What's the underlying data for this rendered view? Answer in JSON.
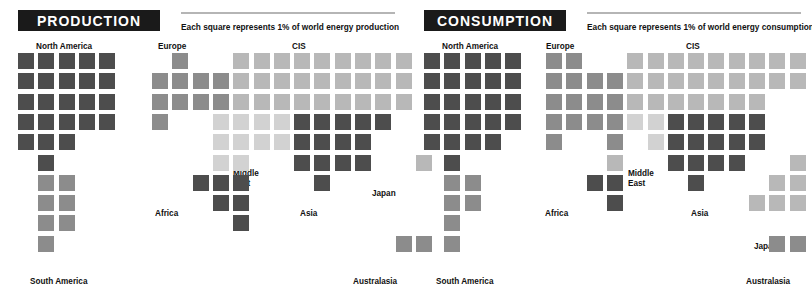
{
  "chart_data": {
    "type": "heatmap",
    "unit_note": "Each square represents 1% of world energy",
    "legend": {
      "production": "Each square represents 1% of world energy production",
      "consumption": "Each square represents 1% of world energy consumption"
    },
    "colors": {
      "dark": "#4d4d4d",
      "mid": "#8c8c8c",
      "light": "#b8b8b8",
      "pale": "#d2d2d2",
      "banner_bg": "#1a1a1a",
      "banner_text": "#ffffff",
      "rule": "#b5b5b5",
      "label_text": "#111111",
      "background": "#ffffff"
    },
    "regions": [
      "North America",
      "South America",
      "Europe",
      "CIS",
      "Middle East",
      "Africa",
      "Asia",
      "Japan",
      "Australasia"
    ],
    "panels": [
      {
        "key": "production",
        "title": "PRODUCTION",
        "legend": "Each square represents 1% of world energy production",
        "series_name": "Share of world energy production (%)",
        "values": {
          "North America": 23,
          "South America": 8,
          "Europe": 9,
          "CIS": 22,
          "Middle East": 11,
          "Africa": 8,
          "Asia": 16,
          "Japan": 1,
          "Australasia": 2
        }
      },
      {
        "key": "consumption",
        "title": "CONSUMPTION",
        "legend": "Each square represents 1% of world energy consumption",
        "series_name": "Share of world energy consumption (%)",
        "values": {
          "North America": 25,
          "South America": 6,
          "Europe": 19,
          "CIS": 15,
          "Middle East": 4,
          "Africa": 4,
          "Asia": 19,
          "Japan": 5,
          "Australasia": 2
        }
      }
    ]
  },
  "production": {
    "title": "PRODUCTION",
    "legend": "Each square represents 1% of world energy production",
    "labels": {
      "north_america": "North America",
      "south_america": "South America",
      "europe": "Europe",
      "cis": "CIS",
      "middle_east_line1": "Middle",
      "middle_east_line2": "East",
      "africa": "Africa",
      "asia": "Asia",
      "japan": "Japan",
      "australasia": "Australasia"
    }
  },
  "consumption": {
    "title": "CONSUMPTION",
    "legend": "Each square represents 1% of world energy consumption",
    "labels": {
      "north_america": "North America",
      "south_america": "South America",
      "europe": "Europe",
      "cis": "CIS",
      "middle_east_line1": "Middle",
      "middle_east_line2": "East",
      "africa": "Africa",
      "asia": "Asia",
      "japan": "Japan",
      "australasia": "Australasia"
    }
  },
  "cells": {
    "production_americas": [
      {
        "c": 0,
        "r": 0,
        "t": "dark"
      },
      {
        "c": 1,
        "r": 0,
        "t": "dark"
      },
      {
        "c": 2,
        "r": 0,
        "t": "dark"
      },
      {
        "c": 3,
        "r": 0,
        "t": "dark"
      },
      {
        "c": 4,
        "r": 0,
        "t": "dark"
      },
      {
        "c": 0,
        "r": 1,
        "t": "dark"
      },
      {
        "c": 1,
        "r": 1,
        "t": "dark"
      },
      {
        "c": 2,
        "r": 1,
        "t": "dark"
      },
      {
        "c": 3,
        "r": 1,
        "t": "dark"
      },
      {
        "c": 4,
        "r": 1,
        "t": "dark"
      },
      {
        "c": 0,
        "r": 2,
        "t": "dark"
      },
      {
        "c": 1,
        "r": 2,
        "t": "dark"
      },
      {
        "c": 2,
        "r": 2,
        "t": "dark"
      },
      {
        "c": 3,
        "r": 2,
        "t": "dark"
      },
      {
        "c": 4,
        "r": 2,
        "t": "dark"
      },
      {
        "c": 0,
        "r": 3,
        "t": "dark"
      },
      {
        "c": 1,
        "r": 3,
        "t": "dark"
      },
      {
        "c": 2,
        "r": 3,
        "t": "dark"
      },
      {
        "c": 3,
        "r": 3,
        "t": "dark"
      },
      {
        "c": 4,
        "r": 3,
        "t": "dark"
      },
      {
        "c": 0,
        "r": 4,
        "t": "dark"
      },
      {
        "c": 1,
        "r": 4,
        "t": "dark"
      },
      {
        "c": 2,
        "r": 4,
        "t": "dark"
      },
      {
        "c": 1,
        "r": 5,
        "t": "dark"
      },
      {
        "c": 1,
        "r": 6,
        "t": "mid"
      },
      {
        "c": 2,
        "r": 6,
        "t": "mid"
      },
      {
        "c": 1,
        "r": 7,
        "t": "mid"
      },
      {
        "c": 2,
        "r": 7,
        "t": "mid"
      },
      {
        "c": 1,
        "r": 8,
        "t": "mid"
      },
      {
        "c": 2,
        "r": 8,
        "t": "mid"
      },
      {
        "c": 1,
        "r": 9,
        "t": "mid"
      }
    ],
    "production_world": [
      {
        "c": 1,
        "r": 0,
        "t": "mid"
      },
      {
        "c": 4,
        "r": 0,
        "t": "light"
      },
      {
        "c": 5,
        "r": 0,
        "t": "light"
      },
      {
        "c": 6,
        "r": 0,
        "t": "light"
      },
      {
        "c": 7,
        "r": 0,
        "t": "light"
      },
      {
        "c": 8,
        "r": 0,
        "t": "light"
      },
      {
        "c": 9,
        "r": 0,
        "t": "light"
      },
      {
        "c": 10,
        "r": 0,
        "t": "light"
      },
      {
        "c": 11,
        "r": 0,
        "t": "light"
      },
      {
        "c": 12,
        "r": 0,
        "t": "light"
      },
      {
        "c": 0,
        "r": 1,
        "t": "mid"
      },
      {
        "c": 1,
        "r": 1,
        "t": "mid"
      },
      {
        "c": 2,
        "r": 1,
        "t": "mid"
      },
      {
        "c": 3,
        "r": 1,
        "t": "mid"
      },
      {
        "c": 4,
        "r": 1,
        "t": "light"
      },
      {
        "c": 5,
        "r": 1,
        "t": "light"
      },
      {
        "c": 6,
        "r": 1,
        "t": "light"
      },
      {
        "c": 7,
        "r": 1,
        "t": "light"
      },
      {
        "c": 8,
        "r": 1,
        "t": "light"
      },
      {
        "c": 9,
        "r": 1,
        "t": "light"
      },
      {
        "c": 10,
        "r": 1,
        "t": "light"
      },
      {
        "c": 11,
        "r": 1,
        "t": "light"
      },
      {
        "c": 12,
        "r": 1,
        "t": "light"
      },
      {
        "c": 0,
        "r": 2,
        "t": "mid"
      },
      {
        "c": 1,
        "r": 2,
        "t": "mid"
      },
      {
        "c": 2,
        "r": 2,
        "t": "mid"
      },
      {
        "c": 3,
        "r": 2,
        "t": "mid"
      },
      {
        "c": 4,
        "r": 2,
        "t": "light"
      },
      {
        "c": 5,
        "r": 2,
        "t": "light"
      },
      {
        "c": 6,
        "r": 2,
        "t": "light"
      },
      {
        "c": 7,
        "r": 2,
        "t": "light"
      },
      {
        "c": 8,
        "r": 2,
        "t": "light"
      },
      {
        "c": 9,
        "r": 2,
        "t": "light"
      },
      {
        "c": 10,
        "r": 2,
        "t": "light"
      },
      {
        "c": 11,
        "r": 2,
        "t": "light"
      },
      {
        "c": 12,
        "r": 2,
        "t": "light"
      },
      {
        "c": 0,
        "r": 3,
        "t": "mid"
      },
      {
        "c": 3,
        "r": 3,
        "t": "pale"
      },
      {
        "c": 4,
        "r": 3,
        "t": "pale"
      },
      {
        "c": 5,
        "r": 3,
        "t": "pale"
      },
      {
        "c": 6,
        "r": 3,
        "t": "pale"
      },
      {
        "c": 7,
        "r": 3,
        "t": "dark"
      },
      {
        "c": 8,
        "r": 3,
        "t": "dark"
      },
      {
        "c": 9,
        "r": 3,
        "t": "dark"
      },
      {
        "c": 10,
        "r": 3,
        "t": "dark"
      },
      {
        "c": 11,
        "r": 3,
        "t": "dark"
      },
      {
        "c": 3,
        "r": 4,
        "t": "pale"
      },
      {
        "c": 4,
        "r": 4,
        "t": "pale"
      },
      {
        "c": 5,
        "r": 4,
        "t": "pale"
      },
      {
        "c": 6,
        "r": 4,
        "t": "pale"
      },
      {
        "c": 7,
        "r": 4,
        "t": "dark"
      },
      {
        "c": 8,
        "r": 4,
        "t": "dark"
      },
      {
        "c": 9,
        "r": 4,
        "t": "dark"
      },
      {
        "c": 10,
        "r": 4,
        "t": "dark"
      },
      {
        "c": 3,
        "r": 5,
        "t": "pale"
      },
      {
        "c": 4,
        "r": 5,
        "t": "pale"
      },
      {
        "c": 7,
        "r": 5,
        "t": "dark"
      },
      {
        "c": 8,
        "r": 5,
        "t": "dark"
      },
      {
        "c": 9,
        "r": 5,
        "t": "dark"
      },
      {
        "c": 10,
        "r": 5,
        "t": "dark"
      },
      {
        "c": 13,
        "r": 5,
        "t": "light"
      },
      {
        "c": 2,
        "r": 6,
        "t": "dark"
      },
      {
        "c": 3,
        "r": 6,
        "t": "dark"
      },
      {
        "c": 4,
        "r": 6,
        "t": "dark"
      },
      {
        "c": 8,
        "r": 6,
        "t": "dark"
      },
      {
        "c": 3,
        "r": 7,
        "t": "dark"
      },
      {
        "c": 4,
        "r": 7,
        "t": "dark"
      },
      {
        "c": 4,
        "r": 8,
        "t": "dark"
      },
      {
        "c": 12,
        "r": 9,
        "t": "mid"
      },
      {
        "c": 13,
        "r": 9,
        "t": "mid"
      }
    ],
    "consumption_americas": [
      {
        "c": 0,
        "r": 0,
        "t": "dark"
      },
      {
        "c": 1,
        "r": 0,
        "t": "dark"
      },
      {
        "c": 2,
        "r": 0,
        "t": "dark"
      },
      {
        "c": 3,
        "r": 0,
        "t": "dark"
      },
      {
        "c": 4,
        "r": 0,
        "t": "dark"
      },
      {
        "c": 0,
        "r": 1,
        "t": "dark"
      },
      {
        "c": 1,
        "r": 1,
        "t": "dark"
      },
      {
        "c": 2,
        "r": 1,
        "t": "dark"
      },
      {
        "c": 3,
        "r": 1,
        "t": "dark"
      },
      {
        "c": 4,
        "r": 1,
        "t": "dark"
      },
      {
        "c": 0,
        "r": 2,
        "t": "dark"
      },
      {
        "c": 1,
        "r": 2,
        "t": "dark"
      },
      {
        "c": 2,
        "r": 2,
        "t": "dark"
      },
      {
        "c": 3,
        "r": 2,
        "t": "dark"
      },
      {
        "c": 4,
        "r": 2,
        "t": "dark"
      },
      {
        "c": 0,
        "r": 3,
        "t": "dark"
      },
      {
        "c": 1,
        "r": 3,
        "t": "dark"
      },
      {
        "c": 2,
        "r": 3,
        "t": "dark"
      },
      {
        "c": 3,
        "r": 3,
        "t": "dark"
      },
      {
        "c": 4,
        "r": 3,
        "t": "dark"
      },
      {
        "c": 0,
        "r": 4,
        "t": "dark"
      },
      {
        "c": 1,
        "r": 4,
        "t": "dark"
      },
      {
        "c": 2,
        "r": 4,
        "t": "dark"
      },
      {
        "c": 3,
        "r": 4,
        "t": "dark"
      },
      {
        "c": 1,
        "r": 5,
        "t": "dark"
      },
      {
        "c": 1,
        "r": 6,
        "t": "mid"
      },
      {
        "c": 2,
        "r": 6,
        "t": "mid"
      },
      {
        "c": 1,
        "r": 7,
        "t": "mid"
      },
      {
        "c": 2,
        "r": 7,
        "t": "mid"
      },
      {
        "c": 1,
        "r": 8,
        "t": "mid"
      },
      {
        "c": 1,
        "r": 9,
        "t": "mid"
      }
    ],
    "consumption_world": [
      {
        "c": 0,
        "r": 0,
        "t": "mid"
      },
      {
        "c": 1,
        "r": 0,
        "t": "mid"
      },
      {
        "c": 4,
        "r": 0,
        "t": "light"
      },
      {
        "c": 5,
        "r": 0,
        "t": "light"
      },
      {
        "c": 6,
        "r": 0,
        "t": "light"
      },
      {
        "c": 7,
        "r": 0,
        "t": "light"
      },
      {
        "c": 8,
        "r": 0,
        "t": "light"
      },
      {
        "c": 9,
        "r": 0,
        "t": "light"
      },
      {
        "c": 10,
        "r": 0,
        "t": "light"
      },
      {
        "c": 11,
        "r": 0,
        "t": "light"
      },
      {
        "c": 12,
        "r": 0,
        "t": "light"
      },
      {
        "c": 0,
        "r": 1,
        "t": "mid"
      },
      {
        "c": 1,
        "r": 1,
        "t": "mid"
      },
      {
        "c": 2,
        "r": 1,
        "t": "mid"
      },
      {
        "c": 3,
        "r": 1,
        "t": "mid"
      },
      {
        "c": 4,
        "r": 1,
        "t": "light"
      },
      {
        "c": 5,
        "r": 1,
        "t": "light"
      },
      {
        "c": 6,
        "r": 1,
        "t": "light"
      },
      {
        "c": 7,
        "r": 1,
        "t": "light"
      },
      {
        "c": 8,
        "r": 1,
        "t": "light"
      },
      {
        "c": 9,
        "r": 1,
        "t": "light"
      },
      {
        "c": 10,
        "r": 1,
        "t": "light"
      },
      {
        "c": 11,
        "r": 1,
        "t": "light"
      },
      {
        "c": 12,
        "r": 1,
        "t": "light"
      },
      {
        "c": 0,
        "r": 2,
        "t": "mid"
      },
      {
        "c": 1,
        "r": 2,
        "t": "mid"
      },
      {
        "c": 2,
        "r": 2,
        "t": "mid"
      },
      {
        "c": 3,
        "r": 2,
        "t": "mid"
      },
      {
        "c": 4,
        "r": 2,
        "t": "light"
      },
      {
        "c": 5,
        "r": 2,
        "t": "light"
      },
      {
        "c": 6,
        "r": 2,
        "t": "light"
      },
      {
        "c": 7,
        "r": 2,
        "t": "light"
      },
      {
        "c": 8,
        "r": 2,
        "t": "light"
      },
      {
        "c": 9,
        "r": 2,
        "t": "light"
      },
      {
        "c": 10,
        "r": 2,
        "t": "light"
      },
      {
        "c": 0,
        "r": 3,
        "t": "mid"
      },
      {
        "c": 1,
        "r": 3,
        "t": "mid"
      },
      {
        "c": 2,
        "r": 3,
        "t": "mid"
      },
      {
        "c": 3,
        "r": 3,
        "t": "mid"
      },
      {
        "c": 4,
        "r": 3,
        "t": "pale"
      },
      {
        "c": 5,
        "r": 3,
        "t": "pale"
      },
      {
        "c": 6,
        "r": 3,
        "t": "dark"
      },
      {
        "c": 7,
        "r": 3,
        "t": "dark"
      },
      {
        "c": 8,
        "r": 3,
        "t": "dark"
      },
      {
        "c": 9,
        "r": 3,
        "t": "dark"
      },
      {
        "c": 10,
        "r": 3,
        "t": "dark"
      },
      {
        "c": 0,
        "r": 4,
        "t": "mid"
      },
      {
        "c": 3,
        "r": 4,
        "t": "mid"
      },
      {
        "c": 5,
        "r": 4,
        "t": "pale"
      },
      {
        "c": 6,
        "r": 4,
        "t": "dark"
      },
      {
        "c": 7,
        "r": 4,
        "t": "dark"
      },
      {
        "c": 8,
        "r": 4,
        "t": "dark"
      },
      {
        "c": 9,
        "r": 4,
        "t": "dark"
      },
      {
        "c": 10,
        "r": 4,
        "t": "dark"
      },
      {
        "c": 3,
        "r": 5,
        "t": "light"
      },
      {
        "c": 6,
        "r": 5,
        "t": "dark"
      },
      {
        "c": 7,
        "r": 5,
        "t": "dark"
      },
      {
        "c": 8,
        "r": 5,
        "t": "dark"
      },
      {
        "c": 9,
        "r": 5,
        "t": "dark"
      },
      {
        "c": 12,
        "r": 5,
        "t": "light"
      },
      {
        "c": 2,
        "r": 6,
        "t": "dark"
      },
      {
        "c": 3,
        "r": 6,
        "t": "dark"
      },
      {
        "c": 7,
        "r": 6,
        "t": "dark"
      },
      {
        "c": 11,
        "r": 6,
        "t": "light"
      },
      {
        "c": 12,
        "r": 6,
        "t": "light"
      },
      {
        "c": 3,
        "r": 7,
        "t": "dark"
      },
      {
        "c": 10,
        "r": 7,
        "t": "light"
      },
      {
        "c": 11,
        "r": 7,
        "t": "light"
      },
      {
        "c": 12,
        "r": 7,
        "t": "light"
      },
      {
        "c": 11,
        "r": 9,
        "t": "mid"
      },
      {
        "c": 12,
        "r": 9,
        "t": "mid"
      }
    ]
  }
}
